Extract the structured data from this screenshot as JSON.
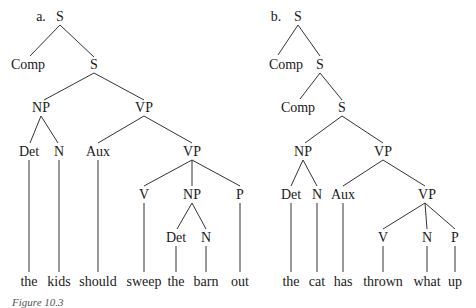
{
  "figure": {
    "caption": "Figure 10.3",
    "trees": [
      {
        "tag": "a.",
        "nodes": {
          "s_root": {
            "label": "S",
            "x": 60,
            "y": 17
          },
          "comp": {
            "label": "Comp",
            "x": 28,
            "y": 65
          },
          "s_inner": {
            "label": "S",
            "x": 94,
            "y": 65
          },
          "np": {
            "label": "NP",
            "x": 41,
            "y": 108
          },
          "vp": {
            "label": "VP",
            "x": 144,
            "y": 108
          },
          "det": {
            "label": "Det",
            "x": 29,
            "y": 152
          },
          "n": {
            "label": "N",
            "x": 59,
            "y": 152
          },
          "aux": {
            "label": "Aux",
            "x": 98,
            "y": 152
          },
          "vp2": {
            "label": "VP",
            "x": 192,
            "y": 152
          },
          "v": {
            "label": "V",
            "x": 144,
            "y": 195
          },
          "np2": {
            "label": "NP",
            "x": 192,
            "y": 195
          },
          "p": {
            "label": "P",
            "x": 240,
            "y": 195
          },
          "det2": {
            "label": "Det",
            "x": 176,
            "y": 238
          },
          "n2": {
            "label": "N",
            "x": 206,
            "y": 238
          }
        },
        "words": [
          {
            "text": "the",
            "x": 29
          },
          {
            "text": "kids",
            "x": 59
          },
          {
            "text": "should",
            "x": 98
          },
          {
            "text": "sweep",
            "x": 144
          },
          {
            "text": "the",
            "x": 176
          },
          {
            "text": "barn",
            "x": 206
          },
          {
            "text": "out",
            "x": 240
          }
        ]
      },
      {
        "tag": "b.",
        "nodes": {
          "s_root": {
            "label": "S",
            "x": 298,
            "y": 17
          },
          "comp": {
            "label": "Comp",
            "x": 286,
            "y": 65
          },
          "s_mid": {
            "label": "S",
            "x": 320,
            "y": 65
          },
          "comp2": {
            "label": "Comp",
            "x": 298,
            "y": 108
          },
          "s_inner": {
            "label": "S",
            "x": 342,
            "y": 108
          },
          "np": {
            "label": "NP",
            "x": 303,
            "y": 152
          },
          "vp": {
            "label": "VP",
            "x": 383,
            "y": 152
          },
          "det": {
            "label": "Det",
            "x": 291,
            "y": 195
          },
          "n": {
            "label": "N",
            "x": 317,
            "y": 195
          },
          "aux": {
            "label": "Aux",
            "x": 343,
            "y": 195
          },
          "vp2": {
            "label": "VP",
            "x": 427,
            "y": 195
          },
          "v": {
            "label": "V",
            "x": 383,
            "y": 238
          },
          "n2": {
            "label": "N",
            "x": 427,
            "y": 238
          },
          "p": {
            "label": "P",
            "x": 455,
            "y": 238
          }
        },
        "words": [
          {
            "text": "the",
            "x": 291
          },
          {
            "text": "cat",
            "x": 317
          },
          {
            "text": "has",
            "x": 343
          },
          {
            "text": "thrown",
            "x": 383
          },
          {
            "text": "what",
            "x": 427
          },
          {
            "text": "up",
            "x": 455
          }
        ]
      }
    ]
  }
}
